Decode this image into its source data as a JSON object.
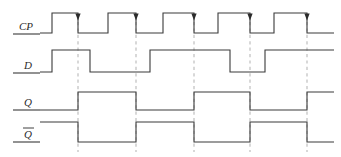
{
  "diagram": {
    "width": 341,
    "height": 157,
    "background_color": "#ffffff",
    "wave_color": "#3a3a3a",
    "grid_color": "#b9b9b9",
    "label_color": "#2b2b2b"
  },
  "labels": {
    "cp": "CP",
    "d": "D",
    "q": "Q",
    "qbar": "Q"
  },
  "chart_data": {
    "type": "line",
    "xlabel": "",
    "ylabel": "",
    "grid": true,
    "legend_position": "left",
    "xlim": [
      40,
      334
    ],
    "trigger_edge": "falling",
    "trigger_times": [
      78,
      136,
      194,
      250,
      307
    ],
    "signals": [
      {
        "name": "CP",
        "label": "CP",
        "high_y": 13,
        "low_y": 33,
        "baseline_x": 40,
        "end_x": 334,
        "initial_level": 0,
        "transitions": [
          {
            "x": 52,
            "level": 1
          },
          {
            "x": 78,
            "level": 0
          },
          {
            "x": 108,
            "level": 1
          },
          {
            "x": 136,
            "level": 0
          },
          {
            "x": 163,
            "level": 1
          },
          {
            "x": 194,
            "level": 0
          },
          {
            "x": 218,
            "level": 1
          },
          {
            "x": 250,
            "level": 0
          },
          {
            "x": 274,
            "level": 1
          },
          {
            "x": 307,
            "level": 0
          }
        ],
        "arrow_marks": [
          78,
          136,
          194,
          250,
          307
        ]
      },
      {
        "name": "D",
        "label": "D",
        "high_y": 50,
        "low_y": 72,
        "baseline_x": 40,
        "end_x": 334,
        "initial_level": 0,
        "transitions": [
          {
            "x": 52,
            "level": 1
          },
          {
            "x": 90,
            "level": 0
          },
          {
            "x": 150,
            "level": 1
          },
          {
            "x": 230,
            "level": 0
          },
          {
            "x": 265,
            "level": 1
          }
        ],
        "arrow_marks": []
      },
      {
        "name": "Q",
        "label": "Q",
        "high_y": 92,
        "low_y": 110,
        "baseline_x": 40,
        "end_x": 334,
        "initial_level": 0,
        "transitions": [
          {
            "x": 78,
            "level": 1
          },
          {
            "x": 136,
            "level": 0
          },
          {
            "x": 194,
            "level": 1
          },
          {
            "x": 250,
            "level": 0
          },
          {
            "x": 307,
            "level": 1
          }
        ],
        "arrow_marks": []
      },
      {
        "name": "Qbar",
        "label": "Q",
        "overline": true,
        "high_y": 122,
        "low_y": 142,
        "baseline_x": 40,
        "end_x": 334,
        "initial_level": 1,
        "transitions": [
          {
            "x": 78,
            "level": 0
          },
          {
            "x": 136,
            "level": 1
          },
          {
            "x": 194,
            "level": 0
          },
          {
            "x": 250,
            "level": 1
          },
          {
            "x": 307,
            "level": 0
          }
        ],
        "arrow_marks": []
      }
    ],
    "grid_lines": [
      {
        "x": 78,
        "y1": 22,
        "y2": 152
      },
      {
        "x": 136,
        "y1": 22,
        "y2": 152
      },
      {
        "x": 194,
        "y1": 22,
        "y2": 152
      },
      {
        "x": 250,
        "y1": 22,
        "y2": 152
      },
      {
        "x": 307,
        "y1": 22,
        "y2": 152
      }
    ],
    "label_positions": [
      {
        "signal": "CP",
        "x": 26,
        "y": 30,
        "rule_y": 34,
        "rule_x1": 13,
        "rule_x2": 40
      },
      {
        "signal": "D",
        "x": 28,
        "y": 69,
        "rule_y": 73,
        "rule_x1": 13,
        "rule_x2": 40
      },
      {
        "signal": "Q",
        "x": 28,
        "y": 106,
        "rule_y": 110,
        "rule_x1": 13,
        "rule_x2": 40
      },
      {
        "signal": "Qbar",
        "x": 28,
        "y": 138,
        "rule_y": 142,
        "rule_x1": 13,
        "rule_x2": 40,
        "bar_y": 128,
        "bar_x1": 23,
        "bar_x2": 34
      }
    ]
  }
}
